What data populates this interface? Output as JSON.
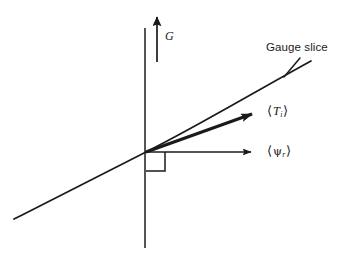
{
  "figure": {
    "type": "line-diagram",
    "background_color": "#ffffff",
    "stroke_color": "#1a1a1a",
    "width": 356,
    "height": 261,
    "labels": {
      "gauge_slice": "Gauge slice",
      "vertical_axis": "G",
      "tangent_vector_open": "⟨",
      "tangent_vector_symbol": "T",
      "tangent_vector_subscript": "i",
      "tangent_vector_close": "⟩",
      "psi_vector_open": "⟨",
      "psi_vector_symbol": "ψ",
      "psi_vector_subscript": "r",
      "psi_vector_close": "⟩"
    },
    "elements": {
      "vertical_axis_line": "vertical gauge orbit line",
      "g_arrow": "upward arrow labelled G",
      "gauge_slice_curve": "curved line rising left to right",
      "tangent_arrow": "thick arrow tangent to curve",
      "psi_arrow": "horizontal arrow to the right",
      "right_angle_marker": "small square indicating 90 degrees"
    },
    "geometry": {
      "origin": [
        146,
        152
      ],
      "vertical_axis": {
        "x": 145,
        "y_top": 28,
        "y_bottom": 248
      },
      "g_arrow": {
        "x": 157,
        "y_tail": 62,
        "y_tip": 12
      },
      "curve_start": [
        14,
        219
      ],
      "curve_end": [
        311,
        61
      ],
      "tangent_arrow_tip": [
        258,
        113
      ],
      "psi_arrow_tip": [
        258,
        152
      ],
      "right_angle_square": {
        "x": 146,
        "y": 152,
        "size": 19
      },
      "gauge_slice_leader": {
        "from": [
          299,
          57
        ],
        "to": [
          283,
          76
        ]
      }
    }
  }
}
